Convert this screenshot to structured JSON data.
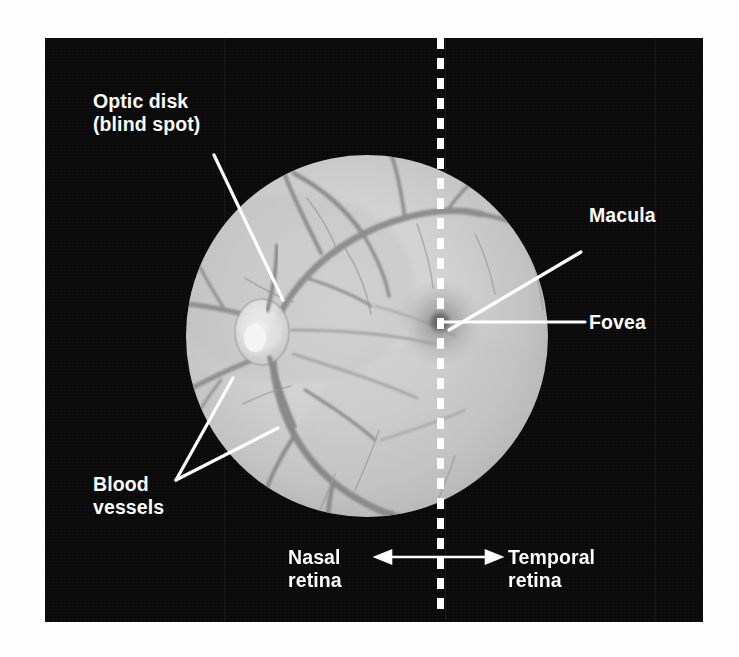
{
  "figure": {
    "kind": "retinal-fundus-photograph",
    "panel_background": "#090909",
    "page_background": "#ffffff",
    "label_color": "#ffffff",
    "retina_tone": "#c9c9c9"
  },
  "labels": {
    "optic_disk_line1": "Optic disk",
    "optic_disk_line2": "(blind spot)",
    "blood_vessels_line1": "Blood",
    "blood_vessels_line2": "vessels",
    "macula": "Macula",
    "fovea": "Fovea",
    "nasal_line1": "Nasal",
    "nasal_line2": "retina",
    "temporal_line1": "Temporal",
    "temporal_line2": "retina"
  },
  "anatomy": {
    "fundus_circle": {
      "center_x": 367,
      "center_y": 336,
      "radius": 181
    },
    "optic_disk": {
      "x": 262,
      "y": 332,
      "note": "bright oval, blind spot"
    },
    "macula": {
      "x": 440,
      "y": 320,
      "note": "dark halo region"
    },
    "fovea": {
      "x": 440,
      "y": 322,
      "note": "dark central pit"
    },
    "midline": {
      "x": 440,
      "style": "white-dashed-vertical"
    }
  },
  "orientation": {
    "divider": "dashed vertical midline through fovea",
    "left_side": "Nasal retina",
    "right_side": "Temporal retina",
    "arrow": "double-headed-horizontal"
  }
}
